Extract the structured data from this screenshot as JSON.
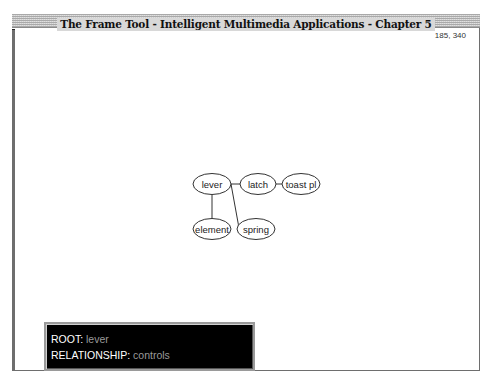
{
  "window": {
    "title": "The Frame Tool - Intelligent Multimedia Applications - Chapter 5",
    "coordinates": "185, 340"
  },
  "graph": {
    "nodes": [
      {
        "id": "lever",
        "label": "lever",
        "cx": 212,
        "cy": 184,
        "rx": 19,
        "ry": 10.5
      },
      {
        "id": "latch",
        "label": "latch",
        "cx": 258,
        "cy": 184,
        "rx": 18,
        "ry": 10.5
      },
      {
        "id": "toast_pl",
        "label": "toast pl",
        "cx": 301,
        "cy": 184,
        "rx": 19,
        "ry": 10.5
      },
      {
        "id": "element",
        "label": "element",
        "cx": 212,
        "cy": 229,
        "rx": 19,
        "ry": 10.5
      },
      {
        "id": "spring",
        "label": "spring",
        "cx": 256,
        "cy": 229,
        "rx": 19,
        "ry": 10.5
      }
    ],
    "edges": [
      {
        "from": "lever",
        "to": "latch",
        "x1": 231,
        "y1": 184,
        "x2": 240,
        "y2": 184
      },
      {
        "from": "latch",
        "to": "toast_pl",
        "x1": 276,
        "y1": 184,
        "x2": 282,
        "y2": 184
      },
      {
        "from": "lever",
        "to": "element",
        "x1": 212,
        "y1": 195,
        "x2": 212,
        "y2": 219
      },
      {
        "from": "lever",
        "to": "spring",
        "x1": 231,
        "y1": 184,
        "x2": 239,
        "y2": 228
      }
    ]
  },
  "info_panel": {
    "root_label": "ROOT:",
    "root_value": "lever",
    "relationship_label": "RELATIONSHIP:",
    "relationship_value": "controls"
  }
}
